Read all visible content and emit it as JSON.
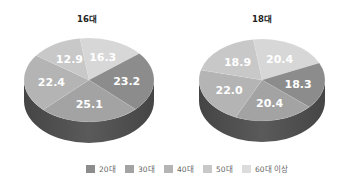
{
  "chart_data": [
    {
      "type": "pie",
      "title": "16대",
      "categories": [
        "20대",
        "30대",
        "40대",
        "50대",
        "60대 이상"
      ],
      "values": [
        23.2,
        25.1,
        22.4,
        12.9,
        16.3
      ],
      "style": "3d-tilted"
    },
    {
      "type": "pie",
      "title": "18대",
      "categories": [
        "20대",
        "30대",
        "40대",
        "50대",
        "60대 이상"
      ],
      "values": [
        18.3,
        20.4,
        22.0,
        18.9,
        20.4
      ],
      "style": "3d-tilted"
    }
  ],
  "legend": {
    "position": "bottom",
    "items": [
      {
        "label": "20대",
        "color": "#8c8c8c"
      },
      {
        "label": "30대",
        "color": "#a3a3a3"
      },
      {
        "label": "40대",
        "color": "#b4b4b4"
      },
      {
        "label": "50대",
        "color": "#c8c8c8"
      },
      {
        "label": "60대 이상",
        "color": "#dcdcdc"
      }
    ]
  },
  "colors": {
    "slices": [
      "#8c8c8c",
      "#a3a3a3",
      "#b4b4b4",
      "#c8c8c8",
      "#d7d7d7"
    ],
    "side": "#5a5a5a",
    "side_dark": "#454545"
  }
}
